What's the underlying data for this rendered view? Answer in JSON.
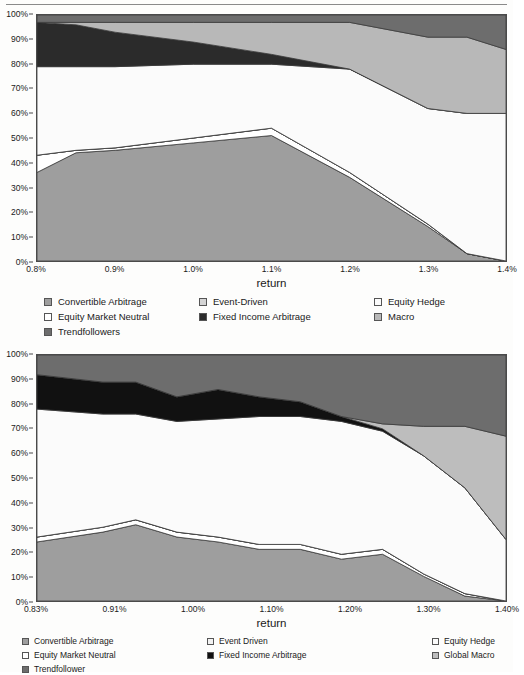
{
  "page": {
    "top_rule": true
  },
  "figures": [
    {
      "id": "chart-1",
      "axis": {
        "xlabel": "return",
        "ylabel": "",
        "yticks": [
          "0%",
          "10%",
          "20%",
          "30%",
          "40%",
          "50%",
          "60%",
          "70%",
          "80%",
          "90%",
          "100%"
        ],
        "xticks": [
          "0.8%",
          "0.9%",
          "1.0%",
          "1.1%",
          "1.2%",
          "1.3%",
          "1.4%"
        ]
      },
      "legend": [
        {
          "label": "Convertible Arbitrage",
          "color": "#9e9e9e"
        },
        {
          "label": "Event-Driven",
          "color": "#d4d4d4"
        },
        {
          "label": "Equity Hedge",
          "color": "#fbfbfb"
        },
        {
          "label": "Equity Market Neutral",
          "color": "#ffffff"
        },
        {
          "label": "Fixed Income Arbitrage",
          "color": "#2b2b2b"
        },
        {
          "label": "Macro",
          "color": "#b8b8b8"
        },
        {
          "label": "Trendfollowers",
          "color": "#6d6d6d"
        }
      ]
    },
    {
      "id": "chart-2",
      "axis": {
        "xlabel": "return",
        "ylabel": "",
        "yticks": [
          "0%",
          "10%",
          "20%",
          "30%",
          "40%",
          "50%",
          "60%",
          "70%",
          "80%",
          "90%",
          "100%"
        ],
        "xticks": [
          "0.83%",
          "0.91%",
          "1.00%",
          "1.10%",
          "1.20%",
          "1.30%",
          "1.40%"
        ]
      },
      "legend": [
        {
          "label": "Convertible Arbitrage",
          "color": "#9e9e9e"
        },
        {
          "label": "Event Driven",
          "color": "#f2f2f2"
        },
        {
          "label": "Equity Hedge",
          "color": "#fbfbfb"
        },
        {
          "label": "Equity Market Neutral",
          "color": "#ffffff"
        },
        {
          "label": "Fixed Income Arbitrage",
          "color": "#111111"
        },
        {
          "label": "Global Macro",
          "color": "#bdbdbd"
        },
        {
          "label": "Trendfollower",
          "color": "#6d6d6d"
        }
      ]
    }
  ],
  "chart_data": [
    {
      "type": "area",
      "stacked": true,
      "title": "",
      "xlabel": "return",
      "ylabel": "",
      "xlim": [
        0.8,
        1.4
      ],
      "ylim": [
        0,
        100
      ],
      "grid": false,
      "legend_position": "bottom",
      "x": [
        0.8,
        0.85,
        0.9,
        1.0,
        1.1,
        1.2,
        1.3,
        1.35,
        1.4
      ],
      "xtick_labels": [
        "0.8%",
        "0.9%",
        "1.0%",
        "1.1%",
        "1.2%",
        "1.3%",
        "1.4%"
      ],
      "ytick_labels": [
        "0%",
        "10%",
        "20%",
        "30%",
        "40%",
        "50%",
        "60%",
        "70%",
        "80%",
        "90%",
        "100%"
      ],
      "series": [
        {
          "name": "Convertible Arbitrage",
          "color": "#9e9e9e",
          "values": [
            36,
            44,
            45,
            48,
            51,
            34,
            14,
            3,
            0
          ]
        },
        {
          "name": "Equity Market Neutral",
          "color": "#ffffff",
          "values": [
            7,
            1,
            1,
            2,
            3,
            2,
            1,
            0,
            0
          ]
        },
        {
          "name": "Event-Driven",
          "color": "#d4d4d4",
          "values": [
            0,
            0,
            0,
            0,
            0,
            0,
            0,
            0,
            0
          ]
        },
        {
          "name": "Equity Hedge",
          "color": "#fbfbfb",
          "values": [
            36,
            34,
            33,
            30,
            26,
            42,
            47,
            57,
            60
          ]
        },
        {
          "name": "Fixed Income Arbitrage",
          "color": "#2b2b2b",
          "values": [
            18,
            17,
            14,
            9,
            4,
            0,
            0,
            0,
            0
          ]
        },
        {
          "name": "Macro",
          "color": "#b8b8b8",
          "values": [
            0,
            1,
            4,
            8,
            13,
            19,
            29,
            31,
            26
          ]
        },
        {
          "name": "Trendfollowers",
          "color": "#6d6d6d",
          "values": [
            3,
            3,
            3,
            3,
            3,
            3,
            9,
            9,
            14
          ]
        }
      ]
    },
    {
      "type": "area",
      "stacked": true,
      "title": "",
      "xlabel": "return",
      "ylabel": "",
      "xlim": [
        0.83,
        1.4
      ],
      "ylim": [
        0,
        100
      ],
      "grid": false,
      "legend_position": "bottom",
      "x": [
        0.83,
        0.91,
        0.95,
        1.0,
        1.05,
        1.1,
        1.15,
        1.2,
        1.25,
        1.3,
        1.35,
        1.4
      ],
      "xtick_labels": [
        "0.83%",
        "0.91%",
        "1.00%",
        "1.10%",
        "1.20%",
        "1.30%",
        "1.40%"
      ],
      "ytick_labels": [
        "0%",
        "10%",
        "20%",
        "30%",
        "40%",
        "50%",
        "60%",
        "70%",
        "80%",
        "90%",
        "100%"
      ],
      "series": [
        {
          "name": "Convertible Arbitrage",
          "color": "#9e9e9e",
          "values": [
            24,
            28,
            31,
            26,
            24,
            21,
            21,
            17,
            19,
            10,
            2,
            0
          ]
        },
        {
          "name": "Equity Market Neutral",
          "color": "#ffffff",
          "values": [
            2,
            2,
            2,
            2,
            2,
            2,
            2,
            2,
            2,
            1,
            1,
            0
          ]
        },
        {
          "name": "Event Driven",
          "color": "#f2f2f2",
          "values": [
            0,
            0,
            0,
            0,
            0,
            0,
            0,
            0,
            0,
            0,
            0,
            0
          ]
        },
        {
          "name": "Equity Hedge",
          "color": "#fbfbfb",
          "values": [
            52,
            46,
            43,
            45,
            48,
            52,
            52,
            54,
            48,
            48,
            43,
            25
          ]
        },
        {
          "name": "Fixed Income Arbitrage",
          "color": "#111111",
          "values": [
            14,
            13,
            13,
            10,
            12,
            8,
            6,
            2,
            1,
            0,
            0,
            0
          ]
        },
        {
          "name": "Global Macro",
          "color": "#bdbdbd",
          "values": [
            0,
            0,
            0,
            0,
            0,
            0,
            0,
            0,
            2,
            12,
            25,
            42
          ]
        },
        {
          "name": "Trendfollower",
          "color": "#6d6d6d",
          "values": [
            8,
            11,
            11,
            17,
            14,
            17,
            19,
            25,
            28,
            29,
            29,
            33
          ]
        }
      ]
    }
  ]
}
